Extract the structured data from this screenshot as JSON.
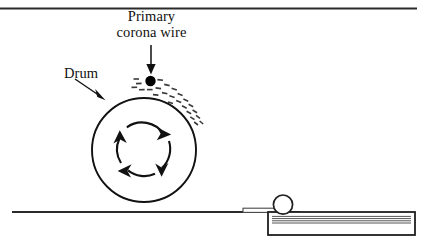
{
  "diagram": {
    "labels": {
      "corona_line1": "Primary",
      "corona_line2": "corona wire",
      "drum": "Drum"
    },
    "colors": {
      "ink": "#111111",
      "line": "#222222",
      "paper_fill": "#ffffff",
      "spray": "#3a3a3a",
      "tray_line": "#555555"
    },
    "parts": {
      "drum": {
        "cx": 144,
        "cy": 150,
        "r": 52,
        "stroke_width": 1.9
      },
      "corona_wire_dot": {
        "cx": 150.5,
        "cy": 81,
        "r": 5.2
      },
      "rotation_arrows": {
        "cx": 144,
        "cy": 150,
        "r": 26,
        "direction": "clockwise",
        "count": 4
      },
      "corona_callout_arrow": {
        "x": 151,
        "y_start": 45,
        "y_end": 73
      },
      "drum_callout_arrow": {
        "x_start": 75,
        "y_start": 79,
        "x_end": 104,
        "y_end": 99
      },
      "top_border": {
        "x1": 0,
        "y1": 8.5,
        "x2": 417,
        "y2": 8.5
      },
      "ground_line": {
        "x1": 12,
        "y1": 212,
        "x2": 300,
        "y2": 212
      },
      "paper_strip": {
        "x": 243,
        "y": 209,
        "width": 36,
        "height": 4
      },
      "feed_roller": {
        "cx": 283,
        "cy": 205,
        "r": 9.5
      },
      "paper_tray": {
        "x": 268,
        "y": 212,
        "width": 147,
        "height": 23
      },
      "tray_stack_lines": 4
    }
  }
}
